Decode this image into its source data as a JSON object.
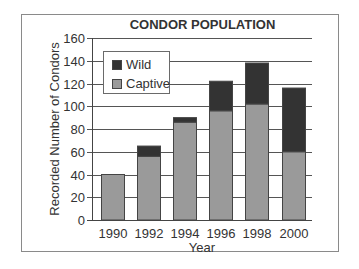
{
  "chart_data": {
    "type": "bar",
    "stacked": true,
    "title": "CONDOR POPULATION",
    "xlabel": "Year",
    "ylabel": "Recorded Number of Condors",
    "categories": [
      "1990",
      "1992",
      "1994",
      "1996",
      "1998",
      "2000"
    ],
    "series": [
      {
        "name": "Captive",
        "color": "#9a9a9a",
        "values": [
          40,
          56,
          86,
          96,
          102,
          60
        ]
      },
      {
        "name": "Wild",
        "color": "#333333",
        "values": [
          0,
          9,
          4,
          26,
          36,
          56
        ]
      }
    ],
    "totals": [
      40,
      65,
      90,
      122,
      138,
      116
    ],
    "ylim": [
      0,
      160
    ],
    "yticks": [
      0,
      20,
      40,
      60,
      80,
      100,
      120,
      140,
      160
    ],
    "grid": true,
    "legend": {
      "position": "upper-left",
      "entries": [
        "Wild",
        "Captive"
      ]
    }
  },
  "legend": {
    "wild": "Wild",
    "captive": "Captive"
  }
}
